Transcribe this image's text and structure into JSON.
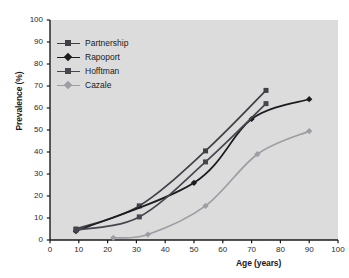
{
  "chart_data": {
    "type": "line",
    "title": "",
    "xlabel": "Age (years)",
    "ylabel": "Prevalence (%)",
    "xlim": [
      0,
      100
    ],
    "ylim": [
      0,
      100
    ],
    "xticks": [
      0,
      10,
      20,
      30,
      40,
      50,
      60,
      70,
      80,
      90,
      100
    ],
    "yticks": [
      0,
      10,
      20,
      30,
      40,
      50,
      60,
      70,
      80,
      90,
      100
    ],
    "grid": false,
    "legend_position": "top-left",
    "plot_background": "#dcdcdc",
    "series": [
      {
        "name": "Partnership",
        "color": "#3f3f46",
        "marker": "square",
        "points": [
          {
            "x": 9,
            "y": 5
          },
          {
            "x": 31,
            "y": 15.5
          },
          {
            "x": 54,
            "y": 40.5
          },
          {
            "x": 75,
            "y": 68
          }
        ]
      },
      {
        "name": "Rapoport",
        "color": "#1c1c20",
        "marker": "diamond",
        "points": [
          {
            "x": 9,
            "y": 4
          },
          {
            "x": 50,
            "y": 26
          },
          {
            "x": 70,
            "y": 55
          },
          {
            "x": 90,
            "y": 64
          }
        ]
      },
      {
        "name": "Hofftman",
        "color": "#46464e",
        "marker": "square",
        "points": [
          {
            "x": 9,
            "y": 4.5
          },
          {
            "x": 31,
            "y": 10.5
          },
          {
            "x": 54,
            "y": 35.5
          },
          {
            "x": 75,
            "y": 62
          }
        ]
      },
      {
        "name": "Cazale",
        "color": "#9d9da3",
        "marker": "diamond",
        "points": [
          {
            "x": 22,
            "y": 1
          },
          {
            "x": 34,
            "y": 2.5
          },
          {
            "x": 54,
            "y": 15.5
          },
          {
            "x": 72,
            "y": 39
          },
          {
            "x": 90,
            "y": 49.5
          }
        ]
      }
    ]
  },
  "axes": {
    "y_title": "Prevalence (%)",
    "x_title": "Age (years)",
    "y_tick_labels": [
      "0",
      "10",
      "20",
      "30",
      "40",
      "50",
      "60",
      "70",
      "80",
      "90",
      "100"
    ],
    "x_tick_labels": [
      "0",
      "10",
      "20",
      "30",
      "40",
      "50",
      "60",
      "70",
      "80",
      "90",
      "100"
    ]
  },
  "legend": {
    "items": [
      {
        "label": "Partnership"
      },
      {
        "label": "Rapoport"
      },
      {
        "label": "Hofftman"
      },
      {
        "label": "Cazale"
      }
    ]
  }
}
